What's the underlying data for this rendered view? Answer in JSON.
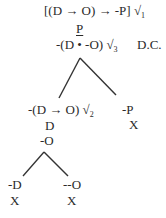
{
  "tree": {
    "root": {
      "formula": "[(D → O) → -P] √",
      "check_index": "1"
    },
    "premise": "P",
    "conclusion_negation": {
      "formula": "-(D • -O) √",
      "check_index": "3",
      "annotation": "D.C."
    },
    "left_branch": {
      "formula": "-(D → O) √",
      "check_index": "2",
      "children": [
        "D",
        "-O"
      ],
      "sub_branches": [
        {
          "formula": "-D",
          "status": "X"
        },
        {
          "formula": "--O",
          "status": "X"
        }
      ]
    },
    "right_branch": {
      "formula": "-P",
      "status": "X"
    }
  },
  "colors": {
    "ink": "#2a2a2a",
    "background": "#ffffff"
  }
}
